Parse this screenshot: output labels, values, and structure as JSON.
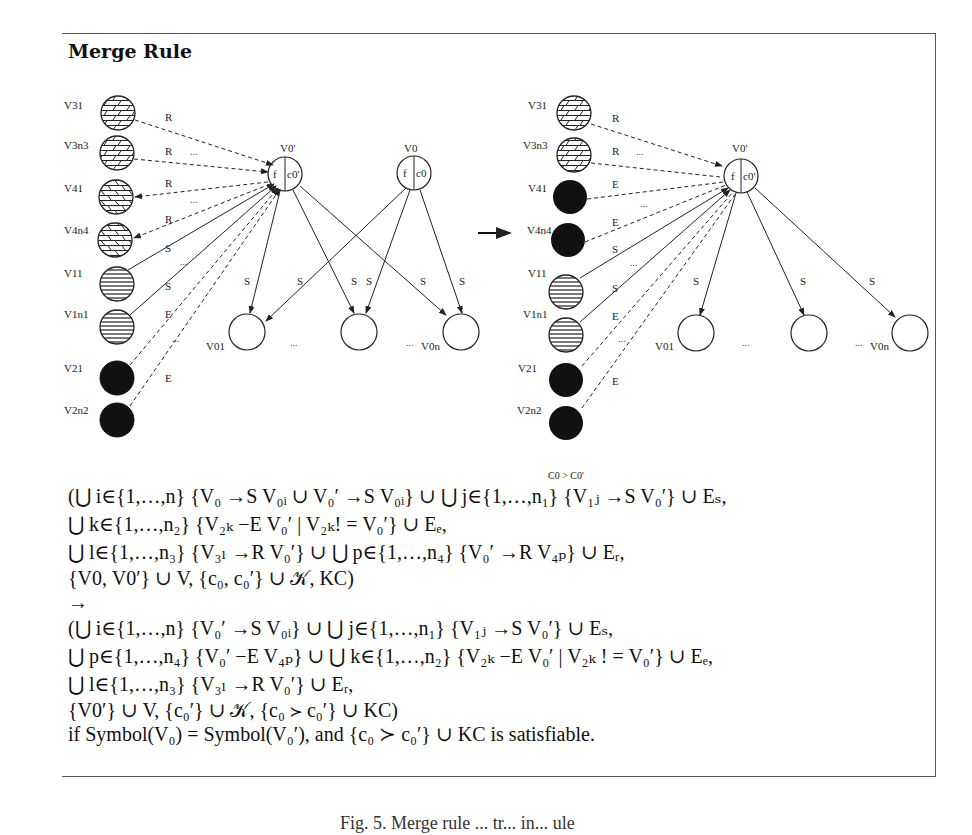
{
  "title": "Merge Rule",
  "annotation": "C0 > C0'",
  "diagram_left": {
    "left_nodes": [
      "V31",
      "V3n3",
      "V41",
      "V4n4",
      "V11",
      "V1n1",
      "V21",
      "V2n2"
    ],
    "center_nodes": [
      "V0'",
      "V0"
    ],
    "center_node_fields": {
      "v0prime": [
        "f",
        "c0'"
      ],
      "v0": [
        "f",
        "c0"
      ]
    },
    "bottom_nodes": [
      "V01",
      "V0n"
    ],
    "edge_labels": [
      "R",
      "R",
      "R",
      "R",
      "S",
      "S",
      "E",
      "E"
    ],
    "fan_edge_labels": [
      "S",
      "S",
      "S",
      "S",
      "S",
      "S"
    ],
    "ellipsis": "..."
  },
  "diagram_right": {
    "left_nodes": [
      "V31",
      "V3n3",
      "V41",
      "V4n4",
      "V11",
      "V1n1",
      "V21",
      "V2n2"
    ],
    "center_node": "V0'",
    "center_node_fields": [
      "f",
      "c0'"
    ],
    "bottom_nodes": [
      "V01",
      "V0n"
    ],
    "edge_labels": [
      "R",
      "R",
      "E",
      "E",
      "S",
      "S",
      "E",
      "E"
    ],
    "fan_edge_labels": [
      "S",
      "S",
      "S"
    ],
    "ellipsis": "..."
  },
  "formula": {
    "lines": [
      "(⋃ i∈{1,…,n} {V₀ →S V₀ᵢ ∪ V₀′ →S V₀ᵢ} ∪ ⋃ j∈{1,…,n₁} {V₁ⱼ →S V₀′} ∪ Eₛ,",
      "⋃ k∈{1,…,n₂} {V₂ₖ −E V₀′ | V₂ₖ! = V₀′} ∪ Eₑ,",
      "⋃ l∈{1,…,n₃} {V₃ₗ →R V₀′} ∪ ⋃ p∈{1,…,n₄} {V₀′ →R V₄ₚ} ∪ Eᵣ,",
      "{V0, V0′} ∪ V, {c₀, c₀′} ∪ 𝒦, KC)",
      "→",
      "(⋃ i∈{1,…,n} {V₀′ →S V₀ᵢ} ∪ ⋃ j∈{1,…,n₁} {V₁ⱼ →S V₀′} ∪ Eₛ,",
      "⋃ p∈{1,…,n₄} {V₀′ −E V₄ₚ} ∪ ⋃ k∈{1,…,n₂} {V₂ₖ −E V₀′ | V₂ₖ ! = V₀′} ∪ Eₑ,",
      "⋃ l∈{1,…,n₃} {V₃ₗ →R V₀′} ∪ Eᵣ,",
      "{V0′} ∪ V, {c₀′} ∪ 𝒦, {c₀ ≻ c₀′} ∪ KC)",
      "if Symbol(V₀) = Symbol(V₀′), and {c₀ ≻ c₀′} ∪ KC is satisfiable."
    ]
  },
  "caption": "Fig. 5. Merge rule ... tr... in... ule"
}
